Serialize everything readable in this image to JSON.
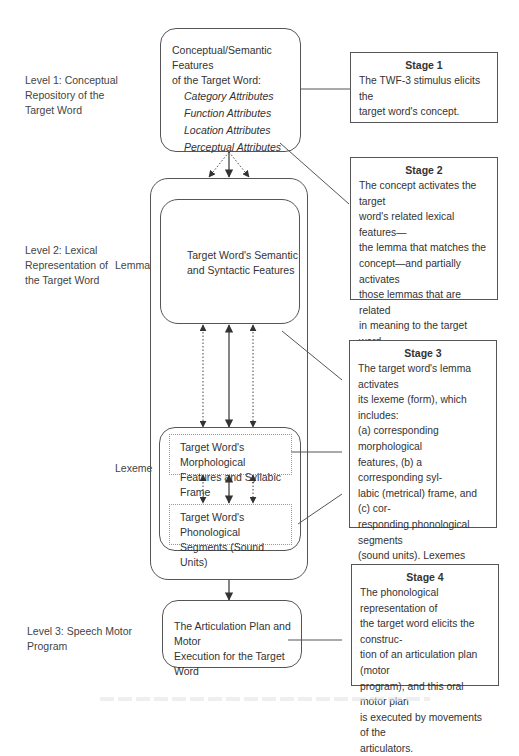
{
  "levels": {
    "level1": [
      "Level 1: Conceptual",
      "Repository of the",
      "Target Word"
    ],
    "level2": [
      "Level 2: Lexical",
      "Representation of",
      "the Target Word"
    ],
    "level3": [
      "Level 3: Speech Motor",
      "Program"
    ]
  },
  "sublabels": {
    "lemma": "Lemma",
    "lexeme": "Lexeme"
  },
  "concept_box": {
    "heading": [
      "Conceptual/Semantic Features",
      "of the Target Word:"
    ],
    "attributes": [
      "Category Attributes",
      "Function Attributes",
      "Location Attributes",
      "Perceptual Attributes"
    ]
  },
  "lemma_box": [
    "Target Word's Semantic",
    "and Syntactic Features"
  ],
  "morph_box": [
    "Target Word's Morphological",
    "Features and Syllabic Frame"
  ],
  "phon_box": [
    "Target Word's Phonological",
    "Segments (Sound Units)"
  ],
  "motor_box": [
    "The Articulation Plan and Motor",
    "Execution for the Target Word"
  ],
  "stages": [
    {
      "title": "Stage 1",
      "lines": [
        "The TWF-3 stimulus elicits the",
        "target word's concept."
      ]
    },
    {
      "title": "Stage 2",
      "lines": [
        "The concept activates the target",
        "word's related lexical features—",
        "the lemma that matches the",
        "concept—and partially activates",
        "those lemmas that are related",
        "in meaning to the target word",
        "(semantic neighbors)."
      ]
    },
    {
      "title": "Stage 3",
      "lines": [
        "The target word's lemma activates",
        "its lexeme (form), which includes:",
        "(a) corresponding morphological",
        "features, (b) a corresponding syl-",
        "labic (metrical) frame, and (c) cor-",
        "responding phonological segments",
        "(sound units). Lexemes related",
        "in sound form to the target word",
        "(phonological neighbors) may also",
        "be partially activated."
      ]
    },
    {
      "title": "Stage 4",
      "lines": [
        "The phonological representation of",
        "the target word elicits the construc-",
        "tion of an articulation plan (motor",
        "program), and this oral motor plan",
        "is executed by movements of the",
        "articulators."
      ]
    }
  ]
}
